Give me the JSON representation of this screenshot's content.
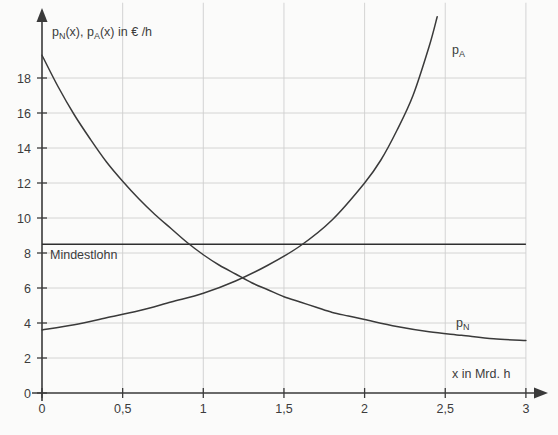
{
  "chart_data": {
    "type": "line",
    "title": "",
    "ylabel": "p_N(x), p_A(x) in € /h",
    "xlabel": "x in Mrd. h",
    "xlim": [
      0,
      3
    ],
    "ylim": [
      0,
      21.5
    ],
    "grid": true,
    "legend_position": "inline-curve-labels",
    "x_ticks": [
      "0",
      "0,5",
      "1",
      "1,5",
      "2",
      "2,5",
      "3"
    ],
    "x_tick_values": [
      0,
      0.5,
      1,
      1.5,
      2,
      2.5,
      3
    ],
    "y_ticks": [
      "0",
      "2",
      "4",
      "6",
      "8",
      "10",
      "12",
      "14",
      "16",
      "18"
    ],
    "y_tick_values": [
      0,
      2,
      4,
      6,
      8,
      10,
      12,
      14,
      16,
      18
    ],
    "series": [
      {
        "name": "p_N",
        "label": "pₙ",
        "label_base": "p",
        "label_sub": "N",
        "description": "Nachfragekurve, fallend",
        "x": [
          0,
          0.1,
          0.2,
          0.3,
          0.4,
          0.5,
          0.6,
          0.7,
          0.8,
          0.9,
          1.0,
          1.1,
          1.2,
          1.3,
          1.4,
          1.5,
          1.6,
          1.7,
          1.8,
          1.9,
          2.0,
          2.2,
          2.4,
          2.6,
          2.8,
          3.0
        ],
        "values": [
          19.3,
          17.5,
          15.9,
          14.5,
          13.2,
          12.1,
          11.1,
          10.2,
          9.4,
          8.6,
          7.9,
          7.3,
          6.8,
          6.3,
          5.9,
          5.5,
          5.2,
          4.9,
          4.6,
          4.4,
          4.2,
          3.8,
          3.5,
          3.3,
          3.1,
          3.0
        ]
      },
      {
        "name": "p_A",
        "label": "pₐ",
        "label_base": "p",
        "label_sub": "A",
        "description": "Angebotskurve, steigend",
        "x": [
          0,
          0.2,
          0.4,
          0.6,
          0.8,
          1.0,
          1.2,
          1.4,
          1.6,
          1.8,
          2.0,
          2.1,
          2.2,
          2.3,
          2.4,
          2.45
        ],
        "values": [
          3.6,
          3.9,
          4.3,
          4.7,
          5.2,
          5.7,
          6.4,
          7.3,
          8.4,
          9.9,
          12.0,
          13.3,
          15.0,
          17.0,
          19.8,
          21.5
        ]
      }
    ],
    "annotations": [
      {
        "name": "Mindestlohn",
        "text": "Mindestlohn",
        "type": "horizontal-line",
        "y_value": 8.5,
        "x_start": 0,
        "x_end": 3,
        "label_x": 0.1,
        "label_y": 8.0
      }
    ],
    "intersection": {
      "x": 1.22,
      "y": 6.0
    },
    "colors": {
      "curve": "#3a3a3a",
      "grid": "#cfcfcf",
      "axis": "#3a3a3a",
      "background": "#fbfbfa",
      "text": "#3c3c3c"
    }
  },
  "labels": {
    "y_axis_title": "p",
    "y_axis_title_sub1": "N",
    "y_axis_title_mid": "(x), p",
    "y_axis_title_sub2": "A",
    "y_axis_title_end": "(x) in € /h",
    "x_axis_title": "x in Mrd. h",
    "min_wage": "Mindestlohn",
    "curve_pn_base": "p",
    "curve_pn_sub": "N",
    "curve_pa_base": "p",
    "curve_pa_sub": "A"
  }
}
